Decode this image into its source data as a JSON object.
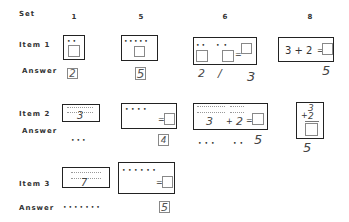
{
  "header": {
    "set_label": "Set",
    "columns": [
      "1",
      "5",
      "6",
      "8"
    ]
  },
  "rows": [
    {
      "label": "Item 1",
      "answer_label": "Answer"
    },
    {
      "label": "Item 2",
      "answer_label": "Answer"
    },
    {
      "label": "Item 3",
      "answer_label": "Answer"
    }
  ],
  "item1": {
    "set1": {
      "dots": "••",
      "answer": "2"
    },
    "set5": {
      "dots": "•••••",
      "answer": "5"
    },
    "set6": {
      "dots_left": "••",
      "dots_right": "••",
      "equals": "=",
      "answers": [
        "2",
        "/",
        "3"
      ]
    },
    "set8": {
      "expression": "3 + 2",
      "equals": "=",
      "answer": "5"
    }
  },
  "item2": {
    "set1": {
      "numeral": "3",
      "answer_dots": "•••"
    },
    "set5": {
      "dots": "••••",
      "equals": "=",
      "answer": "4"
    },
    "set6": {
      "numeral_a": "3",
      "plus": "+",
      "numeral_b": "2",
      "equals": "=",
      "answer_dots_a": "•••",
      "answer_dots_b": "••",
      "answer": "5"
    },
    "set8": {
      "top": "3",
      "bottom": "2",
      "plus": "+",
      "answer": "5"
    }
  },
  "item3": {
    "set1": {
      "numeral": "7",
      "answer_dots": "•••••••"
    },
    "set5": {
      "dots": "••••••",
      "equals": "=",
      "answer": "5"
    }
  }
}
